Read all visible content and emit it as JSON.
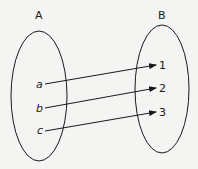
{
  "diagram": {
    "set_a": {
      "label": "A",
      "elements": [
        "a",
        "b",
        "c"
      ]
    },
    "set_b": {
      "label": "B",
      "elements": [
        "1",
        "2",
        "3"
      ]
    },
    "mappings": [
      {
        "from": "a",
        "to": "1"
      },
      {
        "from": "b",
        "to": "2"
      },
      {
        "from": "c",
        "to": "3"
      }
    ],
    "colors": {
      "stroke": "#1a1a1a",
      "background": "#f4f4f2"
    }
  }
}
